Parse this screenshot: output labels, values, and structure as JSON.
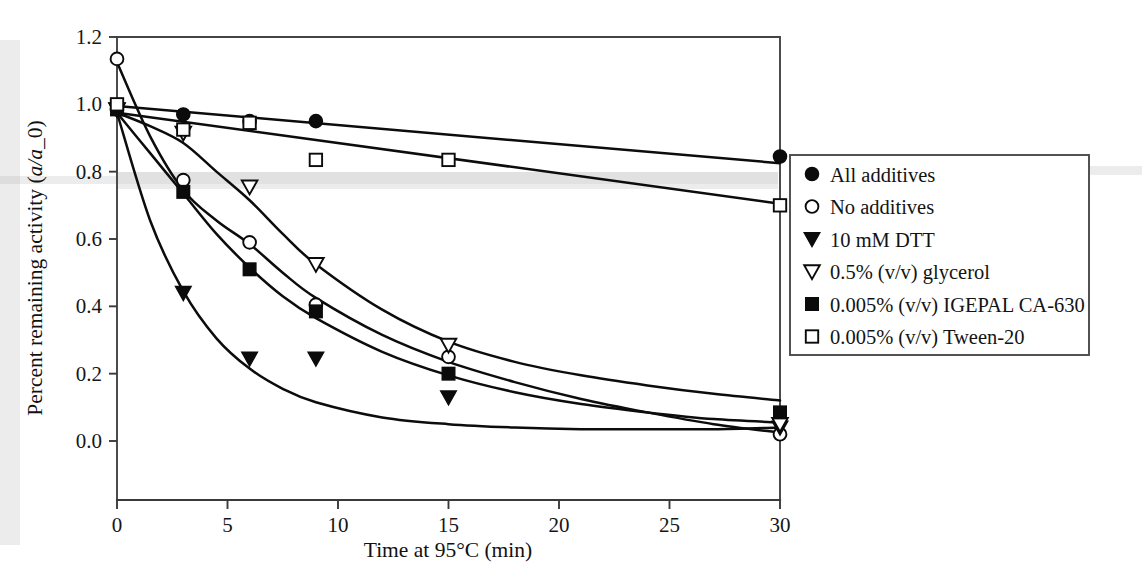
{
  "figure": {
    "background_color": "#ffffff",
    "ink_color": "#0b0b0b",
    "plot_frame": {
      "left": 117,
      "right": 780,
      "top": 37,
      "bottom": 500
    }
  },
  "chart_data": {
    "type": "scatter",
    "title": "",
    "xlabel": "Time at 95°C (min)",
    "ylabel": "Percent remaining activity (a/a_0)",
    "ylabel_parts": {
      "prefix": "Percent remaining activity (",
      "italic": "a/a",
      "suffix": "_0)"
    },
    "xlim": [
      0,
      30
    ],
    "ylim": [
      0.0,
      1.2
    ],
    "xticks": [
      0,
      5,
      10,
      15,
      20,
      25,
      30
    ],
    "xtick_labels": [
      "0",
      "5",
      "10",
      "15",
      "20",
      "25",
      "30"
    ],
    "yticks": [
      0.0,
      0.2,
      0.4,
      0.6,
      0.8,
      1.0,
      1.2
    ],
    "ytick_labels": [
      "0.0",
      "0.2",
      "0.4",
      "0.6",
      "0.8",
      "1.0",
      "1.2"
    ],
    "grid": false,
    "legend_position": "right-outside",
    "series": [
      {
        "name": "All additives",
        "marker": "filled-circle",
        "x": [
          0,
          3,
          6,
          9,
          30
        ],
        "y": [
          0.985,
          0.97,
          0.95,
          0.95,
          0.845
        ],
        "fit_type": "linear",
        "fit_points": [
          [
            0,
            0.995
          ],
          [
            30,
            0.825
          ]
        ]
      },
      {
        "name": "No additives",
        "marker": "open-circle",
        "x": [
          0,
          3,
          6,
          9,
          15,
          30
        ],
        "y": [
          1.135,
          0.775,
          0.59,
          0.405,
          0.25,
          0.02
        ],
        "fit_type": "exponential",
        "fit_points": [
          [
            0,
            1.125
          ],
          [
            1.5,
            0.905
          ],
          [
            3,
            0.745
          ],
          [
            4.5,
            0.655
          ],
          [
            6,
            0.585
          ],
          [
            7.5,
            0.5
          ],
          [
            9,
            0.425
          ],
          [
            12,
            0.315
          ],
          [
            15,
            0.235
          ],
          [
            18,
            0.175
          ],
          [
            21,
            0.125
          ],
          [
            24,
            0.085
          ],
          [
            27,
            0.05
          ],
          [
            30,
            0.025
          ]
        ]
      },
      {
        "name": "10 mM DTT",
        "marker": "filled-triangle-down",
        "x": [
          0,
          3,
          6,
          9,
          15,
          30
        ],
        "y": [
          0.985,
          0.44,
          0.245,
          0.245,
          0.13,
          0.04
        ],
        "fit_type": "exponential",
        "fit_points": [
          [
            0,
            0.975
          ],
          [
            1.5,
            0.655
          ],
          [
            3,
            0.445
          ],
          [
            4.5,
            0.305
          ],
          [
            6,
            0.215
          ],
          [
            7.5,
            0.155
          ],
          [
            9,
            0.115
          ],
          [
            12,
            0.07
          ],
          [
            15,
            0.05
          ],
          [
            18,
            0.04
          ],
          [
            21,
            0.035
          ],
          [
            24,
            0.035
          ],
          [
            27,
            0.035
          ],
          [
            30,
            0.04
          ]
        ]
      },
      {
        "name": "0.5% (v/v) glycerol",
        "marker": "open-triangle-down",
        "x": [
          0,
          3,
          6,
          9,
          15,
          30
        ],
        "y": [
          0.985,
          0.915,
          0.755,
          0.525,
          0.285,
          0.05
        ],
        "fit_type": "exponential",
        "fit_points": [
          [
            0,
            0.975
          ],
          [
            1.5,
            0.935
          ],
          [
            3,
            0.885
          ],
          [
            4.5,
            0.8
          ],
          [
            6,
            0.715
          ],
          [
            7.5,
            0.615
          ],
          [
            9,
            0.525
          ],
          [
            12,
            0.39
          ],
          [
            15,
            0.295
          ],
          [
            18,
            0.235
          ],
          [
            21,
            0.195
          ],
          [
            24,
            0.165
          ],
          [
            27,
            0.14
          ],
          [
            30,
            0.12
          ]
        ]
      },
      {
        "name": "0.005% (v/v) IGEPAL CA-630",
        "marker": "filled-square",
        "x": [
          0,
          3,
          6,
          9,
          15,
          30
        ],
        "y": [
          0.985,
          0.74,
          0.51,
          0.385,
          0.2,
          0.085
        ],
        "fit_type": "exponential",
        "fit_points": [
          [
            0,
            0.975
          ],
          [
            1.5,
            0.855
          ],
          [
            3,
            0.735
          ],
          [
            4.5,
            0.615
          ],
          [
            6,
            0.515
          ],
          [
            7.5,
            0.43
          ],
          [
            9,
            0.365
          ],
          [
            12,
            0.265
          ],
          [
            15,
            0.195
          ],
          [
            18,
            0.145
          ],
          [
            21,
            0.11
          ],
          [
            24,
            0.085
          ],
          [
            27,
            0.065
          ],
          [
            30,
            0.055
          ]
        ]
      },
      {
        "name": "0.005% (v/v) Tween-20",
        "marker": "open-square",
        "x": [
          0,
          3,
          6,
          9,
          15,
          30
        ],
        "y": [
          1.0,
          0.925,
          0.945,
          0.835,
          0.835,
          0.7
        ],
        "fit_type": "linear",
        "fit_points": [
          [
            0,
            0.975
          ],
          [
            30,
            0.705
          ]
        ]
      }
    ]
  },
  "legend": {
    "entries": [
      {
        "marker": "filled-circle",
        "label": "All additives"
      },
      {
        "marker": "open-circle",
        "label": "No additives"
      },
      {
        "marker": "filled-triangle-down",
        "label": "10 mM DTT"
      },
      {
        "marker": "open-triangle-down",
        "label": "0.5% (v/v) glycerol"
      },
      {
        "marker": "filled-square",
        "label": "0.005% (v/v) IGEPAL CA-630"
      },
      {
        "marker": "open-square",
        "label": "0.005% (v/v) Tween-20"
      }
    ]
  }
}
